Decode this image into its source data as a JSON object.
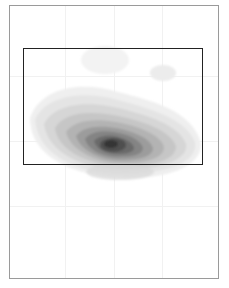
{
  "figure": {
    "colors": {
      "page_border": "#9a9a9a",
      "roi_border": "#222222",
      "peak": "#333333",
      "grid": "#f1f1f1"
    },
    "roi": {
      "x": 23,
      "y": 48,
      "width": 180,
      "height": 117
    },
    "peak": {
      "x": 111,
      "y": 144
    }
  }
}
